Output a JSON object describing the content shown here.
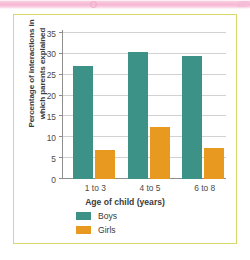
{
  "figure": {
    "frame_color": "#d9d96b",
    "band_color": "#f6b6d3"
  },
  "chart_data": {
    "type": "bar",
    "title": "",
    "xlabel": "Age of child (years)",
    "ylabel": "Percentage of interactions in which parents explained",
    "ylabel_line1": "Percentage of interactions in",
    "ylabel_line2": "which parents explained",
    "categories": [
      "1 to 3",
      "4 to 5",
      "6 to 8"
    ],
    "series": [
      {
        "name": "Boys",
        "color": "#3d9287",
        "values": [
          27,
          30.5,
          29.5
        ]
      },
      {
        "name": "Girls",
        "color": "#e8991f",
        "values": [
          7,
          12.5,
          7.5
        ]
      }
    ],
    "ylim": [
      0,
      35
    ],
    "ytick_labels": [
      "0",
      "5",
      "10",
      "15",
      "20",
      "25",
      "30",
      "35"
    ],
    "ytick_values": [
      0,
      5,
      10,
      15,
      20,
      25,
      30,
      35
    ],
    "grid": true,
    "legend_position": "bottom-left"
  }
}
